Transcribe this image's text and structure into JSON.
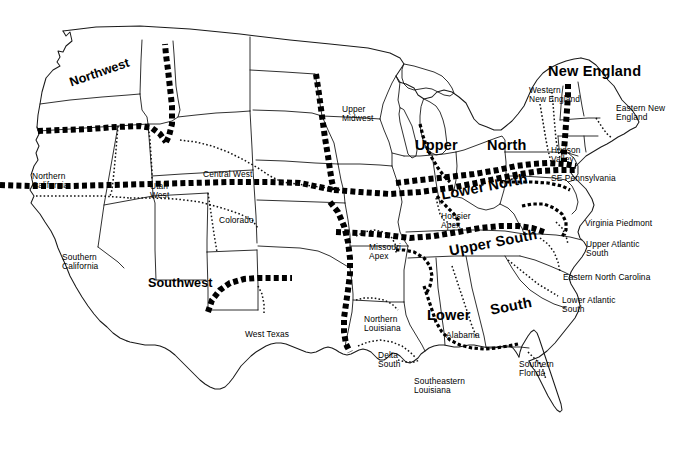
{
  "map": {
    "title": "United States Dialect Regions",
    "background_color": "#ffffff",
    "line_color": "#1a1a1a",
    "boundary_color": "#000000",
    "major_regions": [
      {
        "name": "northwest",
        "label": "Northwest",
        "x": 68,
        "y": 77,
        "rotate": -19,
        "size": "mid"
      },
      {
        "name": "southwest",
        "label": "Southwest",
        "x": 148,
        "y": 277,
        "rotate": 0,
        "size": "mid"
      },
      {
        "name": "upper-north-word1",
        "label": "Upper",
        "x": 415,
        "y": 138,
        "rotate": 0,
        "size": "big"
      },
      {
        "name": "upper-north-word2",
        "label": "North",
        "x": 487,
        "y": 138,
        "rotate": 0,
        "size": "big"
      },
      {
        "name": "lower-north",
        "label": "Lower North",
        "x": 440,
        "y": 188,
        "rotate": -11,
        "size": "big"
      },
      {
        "name": "new-england",
        "label": "New England",
        "x": 548,
        "y": 64,
        "rotate": 0,
        "size": "big"
      },
      {
        "name": "upper-south",
        "label": "Upper South",
        "x": 448,
        "y": 244,
        "rotate": -11,
        "size": "big"
      },
      {
        "name": "lower-south-word1",
        "label": "Lower",
        "x": 427,
        "y": 308,
        "rotate": 0,
        "size": "big"
      },
      {
        "name": "lower-south-word2",
        "label": "South",
        "x": 489,
        "y": 303,
        "rotate": -11,
        "size": "big"
      }
    ],
    "sub_regions": [
      {
        "name": "northern-california",
        "label": "Northern\nCalifornia",
        "x": 32,
        "y": 172
      },
      {
        "name": "southern-california",
        "label": "Southern\nCalifornia",
        "x": 62,
        "y": 253
      },
      {
        "name": "utah-west",
        "label": "Utah\nWest",
        "x": 150,
        "y": 182
      },
      {
        "name": "central-west",
        "label": "Central West",
        "x": 203,
        "y": 170
      },
      {
        "name": "colorado",
        "label": "Colorado",
        "x": 219,
        "y": 216
      },
      {
        "name": "west-texas",
        "label": "West Texas",
        "x": 245,
        "y": 330
      },
      {
        "name": "upper-midwest",
        "label": "Upper\nMidwest",
        "x": 342,
        "y": 105
      },
      {
        "name": "missouri-apex",
        "label": "Missouri\nApex",
        "x": 369,
        "y": 243
      },
      {
        "name": "hoosier-apex",
        "label": "Hoosier\nApex",
        "x": 441,
        "y": 212
      },
      {
        "name": "northern-louisiana",
        "label": "Northern\nLouisiana",
        "x": 364,
        "y": 315
      },
      {
        "name": "delta-south",
        "label": "Delta\nSouth",
        "x": 378,
        "y": 351
      },
      {
        "name": "southeastern-louisiana",
        "label": "Southeastern\nLouisiana",
        "x": 414,
        "y": 377
      },
      {
        "name": "alabama",
        "label": "Alabama",
        "x": 446,
        "y": 331
      },
      {
        "name": "southern-florida",
        "label": "Southern\nFlorida",
        "x": 519,
        "y": 360
      },
      {
        "name": "lower-atlantic-south",
        "label": "Lower Atlantic\nSouth",
        "x": 562,
        "y": 296
      },
      {
        "name": "eastern-north-carolina",
        "label": "Eastern North Carolina",
        "x": 563,
        "y": 273
      },
      {
        "name": "upper-atlantic-south",
        "label": "Upper Atlantic\nSouth",
        "x": 586,
        "y": 240
      },
      {
        "name": "virginia-piedmont",
        "label": "Virginia Piedmont",
        "x": 585,
        "y": 219
      },
      {
        "name": "se-pennsylvania",
        "label": "SE Pennsylvania",
        "x": 551,
        "y": 174
      },
      {
        "name": "hudson-valley",
        "label": "Hudson\nValley",
        "x": 551,
        "y": 146
      },
      {
        "name": "western-new-england",
        "label": "Western\nNew England",
        "x": 529,
        "y": 86
      },
      {
        "name": "eastern-new-england",
        "label": "Eastern New\nEngland",
        "x": 616,
        "y": 104
      }
    ]
  }
}
